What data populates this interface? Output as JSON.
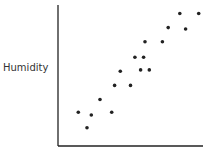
{
  "chart_data": {
    "type": "scatter",
    "title": "",
    "xlabel": "",
    "ylabel": "Humidity",
    "grid": false,
    "legend": null,
    "xlim": [
      0,
      100
    ],
    "ylim": [
      0,
      100
    ],
    "points": [
      {
        "x": 14,
        "y": 24
      },
      {
        "x": 20,
        "y": 13
      },
      {
        "x": 23,
        "y": 22
      },
      {
        "x": 29,
        "y": 33
      },
      {
        "x": 37,
        "y": 24
      },
      {
        "x": 39,
        "y": 43
      },
      {
        "x": 43,
        "y": 53
      },
      {
        "x": 50,
        "y": 43
      },
      {
        "x": 53,
        "y": 63
      },
      {
        "x": 57,
        "y": 54
      },
      {
        "x": 59,
        "y": 63
      },
      {
        "x": 60,
        "y": 74
      },
      {
        "x": 63,
        "y": 54
      },
      {
        "x": 72,
        "y": 74
      },
      {
        "x": 76,
        "y": 84
      },
      {
        "x": 84,
        "y": 94
      },
      {
        "x": 88,
        "y": 83
      },
      {
        "x": 97,
        "y": 94
      }
    ],
    "px": {
      "origin": [
        58,
        146
      ],
      "xend": 203,
      "ytop": 5,
      "xrange_px": [
        58,
        203
      ],
      "yrange_px": [
        146,
        5
      ]
    }
  },
  "labels": {
    "y_axis": "Humidity"
  }
}
